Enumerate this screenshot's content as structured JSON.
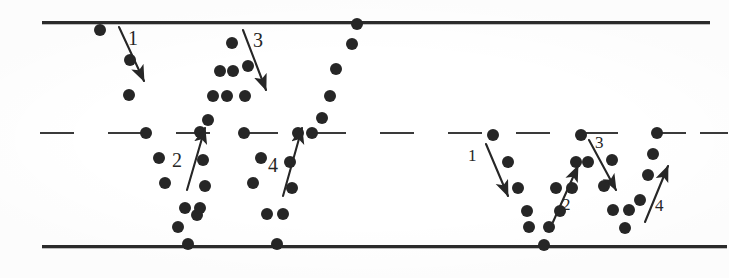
{
  "figure": {
    "width": 729,
    "height": 278,
    "background": "#ffffff",
    "ink_color": "#262626",
    "line_color": "#2b2b2b",
    "dash_color": "#3a3a3a"
  },
  "lines": {
    "top": {
      "name": "top-boundary-line",
      "x": 42,
      "y": 21,
      "width": 668,
      "thickness": 3
    },
    "bottom": {
      "name": "bottom-boundary-line",
      "x": 42,
      "y": 245,
      "width": 685,
      "thickness": 3
    },
    "middle": {
      "name": "center-dashed-line",
      "y": 132,
      "thickness": 2,
      "dashes": [
        {
          "x": 40,
          "w": 34
        },
        {
          "x": 108,
          "w": 36
        },
        {
          "x": 176,
          "w": 34
        },
        {
          "x": 244,
          "w": 34
        },
        {
          "x": 312,
          "w": 34
        },
        {
          "x": 380,
          "w": 34
        },
        {
          "x": 448,
          "w": 34
        },
        {
          "x": 516,
          "w": 34
        },
        {
          "x": 584,
          "w": 34
        },
        {
          "x": 652,
          "w": 34
        },
        {
          "x": 700,
          "w": 28
        }
      ]
    }
  },
  "dots": {
    "radius": 6,
    "positions": [
      [
        100,
        30
      ],
      [
        130,
        60
      ],
      [
        129,
        95
      ],
      [
        146,
        133
      ],
      [
        159,
        158
      ],
      [
        165,
        183
      ],
      [
        185,
        208
      ],
      [
        178,
        227
      ],
      [
        188,
        244
      ],
      [
        197,
        215
      ],
      [
        200,
        208
      ],
      [
        205,
        186
      ],
      [
        203,
        160
      ],
      [
        200,
        132
      ],
      [
        208,
        120
      ],
      [
        213,
        96
      ],
      [
        227,
        96
      ],
      [
        220,
        71
      ],
      [
        233,
        71
      ],
      [
        232,
        43
      ],
      [
        244,
        133
      ],
      [
        245,
        96
      ],
      [
        248,
        66
      ],
      [
        261,
        158
      ],
      [
        253,
        183
      ],
      [
        267,
        214
      ],
      [
        283,
        214
      ],
      [
        277,
        244
      ],
      [
        292,
        188
      ],
      [
        290,
        162
      ],
      [
        298,
        133
      ],
      [
        312,
        133
      ],
      [
        322,
        118
      ],
      [
        330,
        96
      ],
      [
        336,
        69
      ],
      [
        352,
        44
      ],
      [
        357,
        24
      ],
      [
        493,
        135
      ],
      [
        508,
        162
      ],
      [
        518,
        188
      ],
      [
        527,
        211
      ],
      [
        529,
        227
      ],
      [
        549,
        227
      ],
      [
        544,
        245
      ],
      [
        560,
        211
      ],
      [
        556,
        188
      ],
      [
        572,
        188
      ],
      [
        576,
        162
      ],
      [
        588,
        162
      ],
      [
        581,
        135
      ],
      [
        612,
        160
      ],
      [
        604,
        186
      ],
      [
        613,
        210
      ],
      [
        629,
        210
      ],
      [
        625,
        228
      ],
      [
        640,
        200
      ],
      [
        648,
        175
      ],
      [
        653,
        154
      ],
      [
        657,
        133
      ]
    ]
  },
  "arrows": [
    {
      "name": "arrow-1-left",
      "label": "1",
      "direction": "down",
      "x1": 119,
      "y1": 27,
      "x2": 144,
      "y2": 81,
      "label_x": 128,
      "label_y": 28,
      "label_size": 20
    },
    {
      "name": "arrow-2-left",
      "label": "2",
      "direction": "up",
      "x1": 187,
      "y1": 190,
      "x2": 205,
      "y2": 128,
      "label_x": 172,
      "label_y": 150,
      "label_size": 20
    },
    {
      "name": "arrow-3-left",
      "label": "3",
      "direction": "down",
      "x1": 243,
      "y1": 30,
      "x2": 266,
      "y2": 90,
      "label_x": 253,
      "label_y": 30,
      "label_size": 20
    },
    {
      "name": "arrow-4-left",
      "label": "4",
      "direction": "up",
      "x1": 283,
      "y1": 196,
      "x2": 302,
      "y2": 128,
      "label_x": 268,
      "label_y": 155,
      "label_size": 20
    },
    {
      "name": "arrow-1-right",
      "label": "1",
      "direction": "down",
      "x1": 486,
      "y1": 144,
      "x2": 508,
      "y2": 196,
      "label_x": 468,
      "label_y": 147,
      "label_size": 17
    },
    {
      "name": "arrow-2-right",
      "label": "2",
      "direction": "up",
      "x1": 553,
      "y1": 222,
      "x2": 578,
      "y2": 166,
      "label_x": 562,
      "label_y": 196,
      "label_size": 17
    },
    {
      "name": "arrow-3-right",
      "label": "3",
      "direction": "down",
      "x1": 589,
      "y1": 140,
      "x2": 616,
      "y2": 190,
      "label_x": 595,
      "label_y": 134,
      "label_size": 17
    },
    {
      "name": "arrow-4-right",
      "label": "4",
      "direction": "up",
      "x1": 645,
      "y1": 222,
      "x2": 668,
      "y2": 166,
      "label_x": 655,
      "label_y": 197,
      "label_size": 17
    }
  ]
}
